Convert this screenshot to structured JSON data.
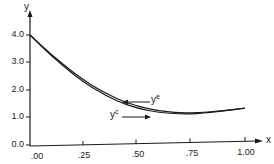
{
  "chart_data": {
    "type": "line",
    "title": "",
    "xlabel": "x",
    "ylabel": "y",
    "xlim": [
      0.0,
      1.0
    ],
    "ylim": [
      0.0,
      4.0
    ],
    "x_ticks": [
      ".00",
      ".25",
      ".50",
      ".75",
      "1.00"
    ],
    "y_ticks": [
      "0.0",
      "1.0",
      "2.0",
      "3.0",
      "4.0"
    ],
    "grid": false,
    "legend": "none (inline arrow annotations)",
    "x": [
      0.0,
      0.1,
      0.2,
      0.25,
      0.3,
      0.4,
      0.5,
      0.6,
      0.7,
      0.75,
      0.8,
      0.9,
      1.0
    ],
    "series": [
      {
        "name": "y^e",
        "values": [
          4.0,
          3.27,
          2.62,
          2.33,
          2.07,
          1.63,
          1.33,
          1.15,
          1.07,
          1.06,
          1.07,
          1.12,
          1.2
        ]
      },
      {
        "name": "y^c",
        "values": [
          4.0,
          3.22,
          2.55,
          2.25,
          1.99,
          1.55,
          1.26,
          1.09,
          1.03,
          1.02,
          1.04,
          1.1,
          1.19
        ]
      }
    ],
    "annotations": [
      {
        "text": "y^e",
        "points_to": "upper curve",
        "at_x": 0.45
      },
      {
        "text": "y^c",
        "points_to": "lower curve",
        "at_x": 0.5
      }
    ]
  },
  "labels": {
    "x_axis": "x",
    "y_axis": "y",
    "ann_e_base": "y",
    "ann_e_sup": "e",
    "ann_c_base": "y",
    "ann_c_sup": "c",
    "yt0": "0.0",
    "yt1": "1.0",
    "yt2": "2.0",
    "yt3": "3.0",
    "yt4": "4.0",
    "xt0": ".00",
    "xt1": ".25",
    "xt2": ".50",
    "xt3": ".75",
    "xt4": "1.00"
  }
}
